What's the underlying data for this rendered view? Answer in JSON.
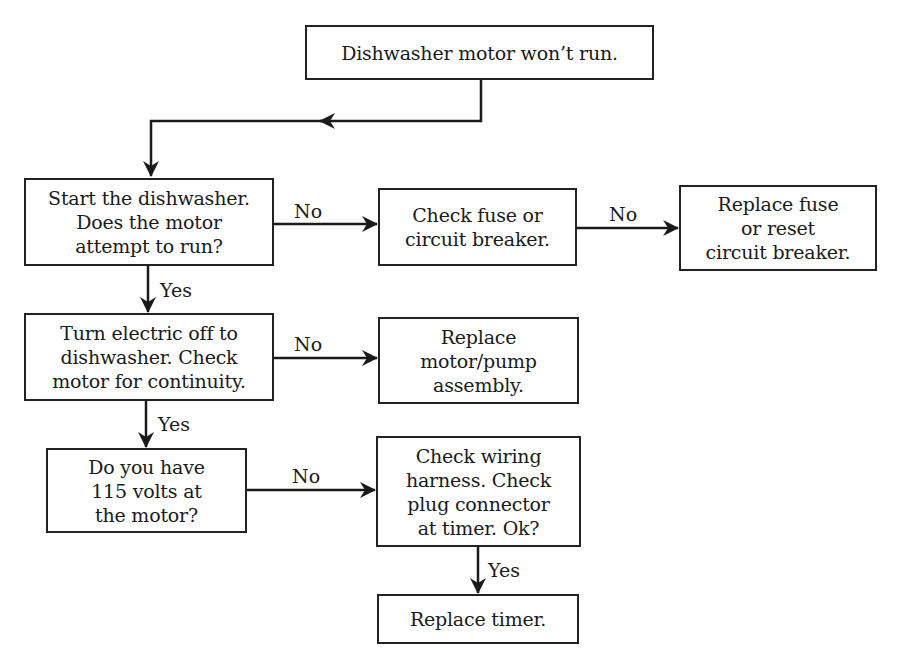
{
  "diagram": {
    "type": "flowchart",
    "title_node": "Dishwasher motor won’t run.",
    "nodes": {
      "start": "Dishwasher motor won’t run.",
      "q1": "Start the dishwasher.\nDoes the motor\nattempt to run?",
      "check_fuse": "Check fuse or\ncircuit breaker.",
      "replace_fuse": "Replace fuse\nor reset\ncircuit breaker.",
      "q2": "Turn electric off to\ndishwasher. Check\nmotor for continuity.",
      "replace_motor": "Replace\nmotor/pump\nassembly.",
      "q3": "Do you have\n115 volts at\nthe motor?",
      "check_wiring": "Check wiring\nharness. Check\nplug connector\nat timer. Ok?",
      "replace_timer": "Replace timer."
    },
    "edge_labels": {
      "q1_no": "No",
      "check_fuse_no": "No",
      "q1_yes": "Yes",
      "q2_no": "No",
      "q2_yes": "Yes",
      "q3_no": "No",
      "check_wiring_yes": "Yes"
    },
    "edges": [
      {
        "from": "start",
        "to": "q1",
        "label": ""
      },
      {
        "from": "q1",
        "to": "check_fuse",
        "label": "No"
      },
      {
        "from": "check_fuse",
        "to": "replace_fuse",
        "label": "No"
      },
      {
        "from": "q1",
        "to": "q2",
        "label": "Yes"
      },
      {
        "from": "q2",
        "to": "replace_motor",
        "label": "No"
      },
      {
        "from": "q2",
        "to": "q3",
        "label": "Yes"
      },
      {
        "from": "q3",
        "to": "check_wiring",
        "label": "No"
      },
      {
        "from": "check_wiring",
        "to": "replace_timer",
        "label": "Yes"
      }
    ],
    "colors": {
      "line": "#1a1a1a",
      "background": "#ffffff"
    }
  }
}
